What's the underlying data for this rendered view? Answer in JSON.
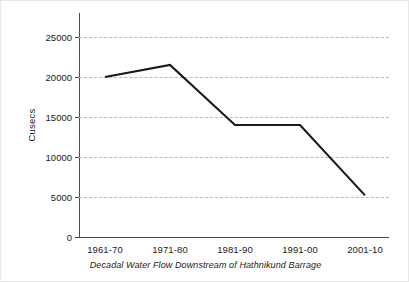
{
  "chart_data": {
    "type": "line",
    "title": "",
    "caption": "Decadal Water Flow Downstream of Hathnikund Barrage",
    "xlabel": "",
    "ylabel": "Cusecs",
    "categories": [
      "1961-70",
      "1971-80",
      "1981-90",
      "1991-00",
      "2001-10"
    ],
    "values": [
      20000,
      21500,
      14000,
      14000,
      5200
    ],
    "series": [
      {
        "name": "Decadal Water Flow",
        "values": [
          20000,
          21500,
          14000,
          14000,
          5200
        ],
        "color": "#1a1a1a"
      }
    ],
    "ylim": [
      0,
      28000
    ],
    "yticks": [
      0,
      5000,
      10000,
      15000,
      20000,
      25000
    ],
    "ytick_labels": [
      "0",
      "5000",
      "10000",
      "15000",
      "20000",
      "25000"
    ],
    "grid": "horizontal-dashed",
    "legend": "none",
    "line_color": "#1a1a1a",
    "grid_color": "#b9b9b9",
    "axis_color": "#4c4c4c"
  }
}
